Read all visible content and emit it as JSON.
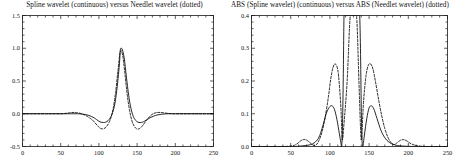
{
  "figure": {
    "background_color": "#ffffff",
    "line_color": "#000000",
    "panels": [
      {
        "id": "left",
        "title": "Spline wavelet (continuous) versus Needlet wavelet (dotted)"
      },
      {
        "id": "right",
        "title": "ABS (Spline wavelet) (continuous) versus ABS (Needlet wavelet) (dotted)"
      }
    ]
  },
  "chart_data": [
    {
      "type": "line",
      "panel": "left",
      "title": "Spline wavelet (continuous) versus Needlet wavelet (dotted)",
      "xlabel": "",
      "ylabel": "",
      "xlim": [
        0,
        250
      ],
      "ylim": [
        -0.5,
        1.5
      ],
      "xticks": [
        0,
        50,
        100,
        150,
        200,
        250
      ],
      "xtick_labels": [
        "0",
        "50",
        "100",
        "150",
        "200",
        "250"
      ],
      "yticks": [
        -0.5,
        0.0,
        0.5,
        1.0,
        1.5
      ],
      "ytick_labels": [
        "-0.5",
        "0.0",
        "0.5",
        "1.0",
        "1.5"
      ],
      "grid": false,
      "legend": "none",
      "series": [
        {
          "name": "Spline wavelet",
          "style": "continuous",
          "color": "#000000",
          "x": [
            0,
            10,
            20,
            30,
            40,
            50,
            58,
            64,
            70,
            74,
            78,
            82,
            86,
            90,
            94,
            97,
            100,
            103,
            106,
            109,
            112,
            115,
            118,
            121,
            124,
            127,
            128,
            130,
            133,
            136,
            139,
            142,
            145,
            148,
            151,
            154,
            157,
            160,
            164,
            168,
            172,
            176,
            182,
            190,
            200,
            215,
            230,
            250
          ],
          "y": [
            0.0,
            0.0,
            0.0,
            0.0,
            0.0,
            0.0,
            0.0,
            0.0,
            0.0,
            0.0,
            -0.005,
            -0.012,
            -0.022,
            -0.04,
            -0.065,
            -0.09,
            -0.115,
            -0.13,
            -0.134,
            -0.128,
            -0.105,
            -0.06,
            0.02,
            0.16,
            0.42,
            0.78,
            0.97,
            0.995,
            0.86,
            0.56,
            0.28,
            0.08,
            -0.04,
            -0.1,
            -0.128,
            -0.134,
            -0.128,
            -0.112,
            -0.082,
            -0.055,
            -0.035,
            -0.02,
            -0.008,
            0.0,
            0.0,
            0.0,
            0.0,
            0.0
          ]
        },
        {
          "name": "Needlet wavelet",
          "style": "dotted",
          "color": "#000000",
          "x": [
            0,
            10,
            20,
            30,
            40,
            50,
            56,
            60,
            64,
            68,
            72,
            76,
            80,
            84,
            88,
            92,
            95,
            98,
            101,
            104,
            107,
            110,
            113,
            116,
            119,
            122,
            125,
            128,
            131,
            134,
            137,
            140,
            143,
            146,
            149,
            152,
            155,
            158,
            161,
            164,
            168,
            172,
            176,
            180,
            184,
            190,
            196,
            205,
            215,
            230,
            250
          ],
          "y": [
            0.0,
            0.0,
            0.0,
            0.0,
            0.0,
            0.0,
            0.005,
            0.012,
            0.018,
            0.02,
            0.015,
            0.005,
            -0.012,
            -0.035,
            -0.065,
            -0.1,
            -0.14,
            -0.18,
            -0.215,
            -0.23,
            -0.225,
            -0.195,
            -0.14,
            -0.05,
            0.1,
            0.34,
            0.66,
            0.95,
            0.9,
            0.62,
            0.3,
            0.06,
            -0.1,
            -0.185,
            -0.228,
            -0.232,
            -0.21,
            -0.17,
            -0.12,
            -0.075,
            -0.025,
            0.005,
            0.018,
            0.02,
            0.015,
            0.006,
            0.0,
            0.0,
            0.0,
            0.0,
            0.0
          ]
        }
      ]
    },
    {
      "type": "line",
      "panel": "right",
      "title": "ABS (Spline wavelet) (continuous) versus ABS (Needlet wavelet) (dotted)",
      "xlabel": "",
      "ylabel": "",
      "xlim": [
        0,
        250
      ],
      "ylim": [
        0.0,
        0.4
      ],
      "xticks": [
        0,
        50,
        100,
        150,
        200,
        250
      ],
      "xtick_labels": [
        "0",
        "50",
        "100",
        "150",
        "200",
        "250"
      ],
      "yticks": [
        0.0,
        0.1,
        0.2,
        0.3,
        0.4
      ],
      "ytick_labels": [
        "0.0",
        "0.1",
        "0.2",
        "0.3",
        "0.4"
      ],
      "grid": false,
      "legend": "none",
      "note": "Central lobe of each curve exceeds the 0.4 y-limit and is clipped at the top frame",
      "series": [
        {
          "name": "ABS (Spline wavelet)",
          "style": "continuous",
          "color": "#000000",
          "x": [
            0,
            20,
            40,
            55,
            65,
            72,
            78,
            84,
            88,
            92,
            96,
            100,
            103,
            106,
            109,
            112,
            114,
            115,
            116,
            117,
            118,
            119,
            120,
            122,
            126,
            130,
            134,
            136,
            137,
            138,
            139,
            140,
            141,
            142,
            144,
            147,
            150,
            153,
            156,
            160,
            165,
            170,
            176,
            184,
            195,
            210,
            230,
            250
          ],
          "y": [
            0.0,
            0.0,
            0.0,
            0.0,
            0.002,
            0.004,
            0.008,
            0.02,
            0.04,
            0.072,
            0.105,
            0.122,
            0.124,
            0.112,
            0.082,
            0.04,
            0.012,
            0.0,
            0.06,
            0.2,
            0.4,
            0.4,
            0.4,
            0.4,
            0.4,
            0.4,
            0.4,
            0.4,
            0.4,
            0.4,
            0.3,
            0.12,
            0.02,
            0.0,
            0.035,
            0.085,
            0.118,
            0.124,
            0.115,
            0.086,
            0.05,
            0.027,
            0.012,
            0.004,
            0.001,
            0.0,
            0.0,
            0.0
          ]
        },
        {
          "name": "ABS (Needlet wavelet)",
          "style": "dotted",
          "color": "#000000",
          "x": [
            0,
            20,
            40,
            52,
            58,
            62,
            66,
            70,
            74,
            78,
            82,
            86,
            90,
            94,
            98,
            101,
            104,
            107,
            110,
            112,
            114,
            115,
            116,
            118,
            122,
            126,
            130,
            134,
            137,
            139,
            140,
            141,
            143,
            146,
            149,
            152,
            155,
            158,
            162,
            166,
            170,
            174,
            178,
            182,
            186,
            190,
            194,
            198,
            204,
            212,
            225,
            240,
            250
          ],
          "y": [
            0.0,
            0.0,
            0.0,
            0.002,
            0.008,
            0.016,
            0.021,
            0.02,
            0.013,
            0.005,
            0.004,
            0.018,
            0.045,
            0.09,
            0.15,
            0.205,
            0.242,
            0.252,
            0.235,
            0.19,
            0.12,
            0.06,
            0.02,
            0.07,
            0.2,
            0.4,
            0.4,
            0.4,
            0.2,
            0.06,
            0.02,
            0.05,
            0.14,
            0.215,
            0.248,
            0.252,
            0.236,
            0.2,
            0.145,
            0.095,
            0.055,
            0.028,
            0.012,
            0.006,
            0.012,
            0.019,
            0.021,
            0.017,
            0.008,
            0.002,
            0.0,
            0.0,
            0.0
          ]
        }
      ]
    }
  ]
}
